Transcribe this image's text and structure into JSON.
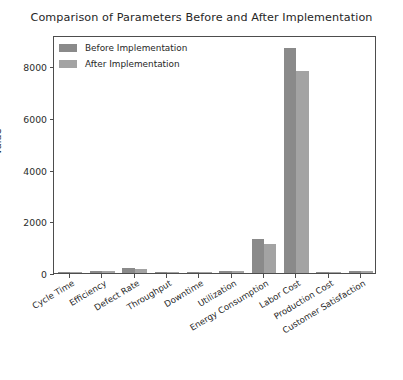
{
  "chart_data": {
    "type": "bar",
    "title": "Comparison of Parameters Before and After Implementation",
    "xlabel": "",
    "ylabel": "Value",
    "ylim": [
      0,
      9200
    ],
    "grid": false,
    "legend_position": "upper left",
    "yticks": [
      "0",
      "2000",
      "4000",
      "6000",
      "8000"
    ],
    "ytick_values": [
      0,
      2000,
      4000,
      6000,
      8000
    ],
    "categories": [
      "Cycle Time",
      "Efficiency",
      "Defect Rate",
      "Throughput",
      "Downtime",
      "Utilization",
      "Energy Consumption",
      "Labor Cost",
      "Production Cost",
      "Customer Satisfaction"
    ],
    "series": [
      {
        "name": "Before Implementation",
        "color": "#8a8a8a",
        "values": [
          12,
          85,
          180,
          45,
          8,
          78,
          1300,
          8700,
          25,
          72
        ]
      },
      {
        "name": "After Implementation",
        "color": "#a3a3a3",
        "values": [
          9,
          92,
          150,
          52,
          5,
          85,
          1120,
          7800,
          20,
          88
        ]
      }
    ]
  },
  "legend": {
    "entries": [
      {
        "label": "Before Implementation"
      },
      {
        "label": "After Implementation"
      }
    ]
  }
}
